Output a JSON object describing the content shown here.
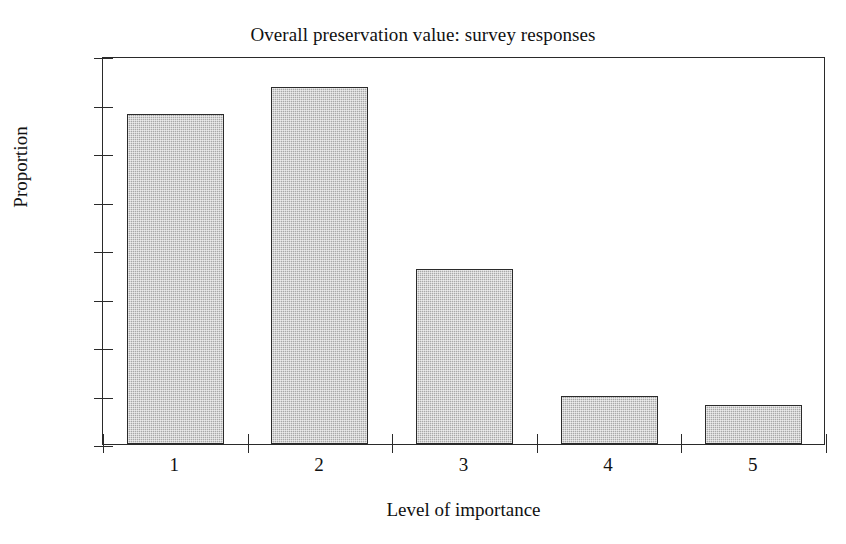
{
  "chart_data": {
    "type": "bar",
    "title": "Overall preservation value: survey responses",
    "xlabel": "Level of importance",
    "ylabel": "Proportion",
    "categories": [
      "1",
      "2",
      "3",
      "4",
      "5"
    ],
    "values": [
      0.34,
      0.368,
      0.18,
      0.05,
      0.04
    ],
    "ylim": [
      0,
      0.4
    ],
    "yticks": [
      0,
      0.05,
      0.1,
      0.15,
      0.2,
      0.25,
      0.3,
      0.35,
      0.4
    ],
    "ytick_labels": [
      "0",
      "0.05",
      "0.1",
      "0.15",
      "0.2",
      "0.25",
      "0.3",
      "0.35",
      "0.4"
    ],
    "grid": false,
    "legend": "none",
    "bar_fill_color": "#b2b2b2",
    "bar_edge_color": "#2b2b2b",
    "axis_color": "#2a2a2a",
    "background_color": "#ffffff"
  }
}
